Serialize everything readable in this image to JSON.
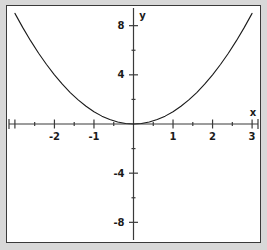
{
  "chart_data": {
    "type": "line",
    "title": "",
    "subtitle": "",
    "xlabel": "x",
    "ylabel": "y",
    "function": "y = x^2",
    "xlim": [
      -3.2,
      3.2
    ],
    "ylim": [
      -9.6,
      9.6
    ],
    "grid": false,
    "legend": null,
    "x_major_ticks": [
      -3,
      -2,
      -1,
      0,
      1,
      2,
      3
    ],
    "x_minor_ticks": [
      -2.5,
      -1.5,
      -0.5,
      0.5,
      1.5,
      2.5
    ],
    "x_tick_labels": [
      "",
      "-2",
      "-1",
      "",
      "1",
      "2",
      "3"
    ],
    "y_major_ticks": [
      -8,
      -4,
      0,
      4,
      8
    ],
    "y_minor_ticks": [
      -6,
      -2,
      2,
      6
    ],
    "y_tick_labels": [
      "-8",
      "-4",
      "",
      "4",
      "8"
    ],
    "series": [
      {
        "name": "y = x^2",
        "color": "#1a1a1a",
        "x": [
          -3.0,
          -2.8,
          -2.6,
          -2.4,
          -2.2,
          -2.0,
          -1.8,
          -1.6,
          -1.4,
          -1.2,
          -1.0,
          -0.8,
          -0.6,
          -0.4,
          -0.2,
          0.0,
          0.2,
          0.4,
          0.6,
          0.8,
          1.0,
          1.2,
          1.4,
          1.6,
          1.8,
          2.0,
          2.2,
          2.4,
          2.6,
          2.8,
          3.0
        ],
        "values": [
          9.0,
          7.84,
          6.76,
          5.76,
          4.84,
          4.0,
          3.24,
          2.56,
          1.96,
          1.44,
          1.0,
          0.64,
          0.36,
          0.16,
          0.04,
          0.0,
          0.04,
          0.16,
          0.36,
          0.64,
          1.0,
          1.44,
          1.96,
          2.56,
          3.24,
          4.0,
          4.84,
          5.76,
          6.76,
          7.84,
          9.0
        ]
      }
    ]
  },
  "axes": {
    "x_label": "x",
    "y_label": "y",
    "x_labels": [
      {
        "text": "-2",
        "value": -2
      },
      {
        "text": "-1",
        "value": -1
      },
      {
        "text": "1",
        "value": 1
      },
      {
        "text": "2",
        "value": 2
      },
      {
        "text": "3",
        "value": 3
      }
    ],
    "y_labels": [
      {
        "text": "8",
        "value": 8
      },
      {
        "text": "4",
        "value": 4
      },
      {
        "text": "-4",
        "value": -4
      },
      {
        "text": "-8",
        "value": -8
      }
    ]
  },
  "colors": {
    "curve": "#1a1a1a",
    "axis": "#3a3a3a",
    "frame": "#3a3a3a",
    "plot_background": "#ffffff",
    "figure_background": "#d8d8d8",
    "text": "#1a1a1a"
  }
}
